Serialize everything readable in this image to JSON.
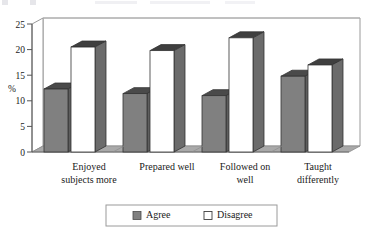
{
  "chart_data": {
    "type": "bar",
    "title": "",
    "subtitle": "",
    "xlabel": "",
    "ylabel": "%",
    "ylim": [
      0,
      25
    ],
    "yticks": [
      0,
      5,
      10,
      15,
      20,
      25
    ],
    "ytick_labels": [
      "0",
      "5",
      "10",
      "15",
      "20",
      "25"
    ],
    "grid": false,
    "legend_position": "bottom",
    "style": "3d-clustered-column",
    "categories": [
      "Enjoyed subjects more",
      "Prepared well",
      "Followed on well",
      "Taught differently"
    ],
    "category_lines": [
      [
        "Enjoyed",
        "subjects more"
      ],
      [
        "Prepared well",
        ""
      ],
      [
        "Followed on",
        "well"
      ],
      [
        "Taught",
        "differently"
      ]
    ],
    "series": [
      {
        "name": "Agree",
        "color": "#808080",
        "side_color": "#5e5e5e",
        "top_color": "#4a4a4a",
        "values": [
          12.3,
          11.4,
          11.0,
          14.8
        ]
      },
      {
        "name": "Disagree",
        "color": "#ffffff",
        "side_color": "#6b6b6b",
        "top_color": "#3f3f3f",
        "values": [
          20.5,
          19.8,
          22.3,
          17.0
        ]
      }
    ]
  },
  "legend": {
    "items": [
      {
        "label": "Agree",
        "swatch": "#808080"
      },
      {
        "label": "Disagree",
        "swatch": "#ffffff"
      }
    ]
  },
  "axis": {
    "y_title": "%",
    "tick_0": "0",
    "tick_5": "5",
    "tick_10": "10",
    "tick_15": "15",
    "tick_20": "20",
    "tick_25": "25"
  },
  "categories": {
    "c0_line1": "Enjoyed",
    "c0_line2": "subjects more",
    "c1_line1": "Prepared well",
    "c1_line2": "",
    "c2_line1": "Followed on",
    "c2_line2": "well",
    "c3_line1": "Taught",
    "c3_line2": "differently"
  },
  "colors": {
    "bar_agree": "#808080",
    "bar_disagree": "#ffffff",
    "frame": "#9a9a9a",
    "floor": "#a8a8a8",
    "axis": "#555555",
    "text": "#1a1a1a"
  }
}
